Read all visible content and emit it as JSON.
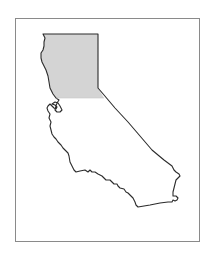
{
  "map": {
    "subject": "California",
    "highlighted_region": "Northern California",
    "colors": {
      "background": "#ffffff",
      "frame_border": "#8a8a8a",
      "state_outline": "#2b2b2b",
      "highlight_fill": "#d4d4d4",
      "state_fill": "#ffffff"
    }
  }
}
